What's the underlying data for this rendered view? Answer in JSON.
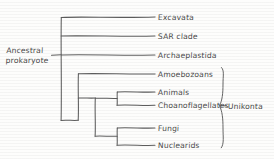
{
  "diagram": {
    "type": "phylogenetic-tree",
    "title": "",
    "style": "hand-drawn cladogram",
    "root_label": "Ancestral prokaryote",
    "line_color": "#5d5d5d",
    "text_color": "#4a4a4a",
    "background_color": "#fdfdfc",
    "tips": [
      {
        "label": "Excavata",
        "y": 17
      },
      {
        "label": "SAR clade",
        "y": 36
      },
      {
        "label": "Archaeplastida",
        "y": 55
      },
      {
        "label": "Amoebozoans",
        "y": 74
      },
      {
        "label": "Animals",
        "y": 92
      },
      {
        "label": "Choanoflagellates",
        "y": 105
      },
      {
        "label": "Fungi",
        "y": 128
      },
      {
        "label": "Nuclearids",
        "y": 145
      }
    ],
    "clade_brackets": [
      {
        "label": "Unikonta",
        "covers": [
          "Amoebozoans",
          "Animals",
          "Choanoflagellates",
          "Fungi",
          "Nuclearids"
        ],
        "top_y": 67,
        "bottom_y": 148,
        "label_y": 106
      }
    ],
    "internal_nodes": [
      {
        "name": "root",
        "x": 61,
        "from_y": 17,
        "to_y": 120
      },
      {
        "name": "unikonta-node",
        "x": 78,
        "from_y": 74,
        "to_y": 120
      },
      {
        "name": "opisthokont-nuclearid-node",
        "x": 95,
        "from_y": 98,
        "to_y": 136
      },
      {
        "name": "animals-choanoflagellates-node",
        "x": 117,
        "from_y": 92,
        "to_y": 105
      },
      {
        "name": "fungi-nuclearids-node",
        "x": 117,
        "from_y": 128,
        "to_y": 145
      }
    ],
    "tip_line_end_x": 155,
    "root_stub": {
      "x1": 51,
      "x2": 61,
      "y": 55
    }
  }
}
